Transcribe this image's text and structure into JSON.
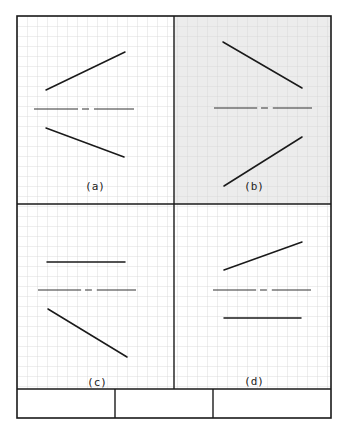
{
  "diagram": {
    "type": "orthographic-line-projection-exercise",
    "colors": {
      "paper": "#ffffff",
      "highlight_fill": "#ececec",
      "grid": "#d6d6d6",
      "border": "#1a1a1a",
      "line": "#1a1a1a",
      "centerline": "#333333"
    },
    "grid_spacing_px": 10,
    "panels": [
      {
        "id": "a",
        "label": "(a)",
        "highlighted": false,
        "segments": [
          {
            "kind": "solid",
            "x1": 46,
            "y1": 90,
            "x2": 125,
            "y2": 52
          },
          {
            "kind": "centerline",
            "y": 109,
            "x1": 34,
            "x2": 134
          },
          {
            "kind": "solid",
            "x1": 46,
            "y1": 128,
            "x2": 124,
            "y2": 157
          }
        ]
      },
      {
        "id": "b",
        "label": "(b)",
        "highlighted": true,
        "segments": [
          {
            "kind": "solid",
            "x1": 223,
            "y1": 42,
            "x2": 302,
            "y2": 88
          },
          {
            "kind": "centerline",
            "y": 108,
            "x1": 214,
            "x2": 312
          },
          {
            "kind": "solid",
            "x1": 224,
            "y1": 186,
            "x2": 302,
            "y2": 137
          }
        ]
      },
      {
        "id": "c",
        "label": "(c)",
        "highlighted": false,
        "segments": [
          {
            "kind": "solid",
            "x1": 47,
            "y1": 262,
            "x2": 125,
            "y2": 262
          },
          {
            "kind": "centerline",
            "y": 290,
            "x1": 38,
            "x2": 136
          },
          {
            "kind": "solid",
            "x1": 48,
            "y1": 309,
            "x2": 127,
            "y2": 357
          }
        ]
      },
      {
        "id": "d",
        "label": "(d)",
        "highlighted": false,
        "segments": [
          {
            "kind": "solid",
            "x1": 224,
            "y1": 270,
            "x2": 302,
            "y2": 242
          },
          {
            "kind": "centerline",
            "y": 290,
            "x1": 213,
            "x2": 311
          },
          {
            "kind": "solid",
            "x1": 224,
            "y1": 318,
            "x2": 301,
            "y2": 318
          }
        ]
      }
    ],
    "title_block": {
      "cells": [
        "",
        "",
        ""
      ]
    }
  }
}
